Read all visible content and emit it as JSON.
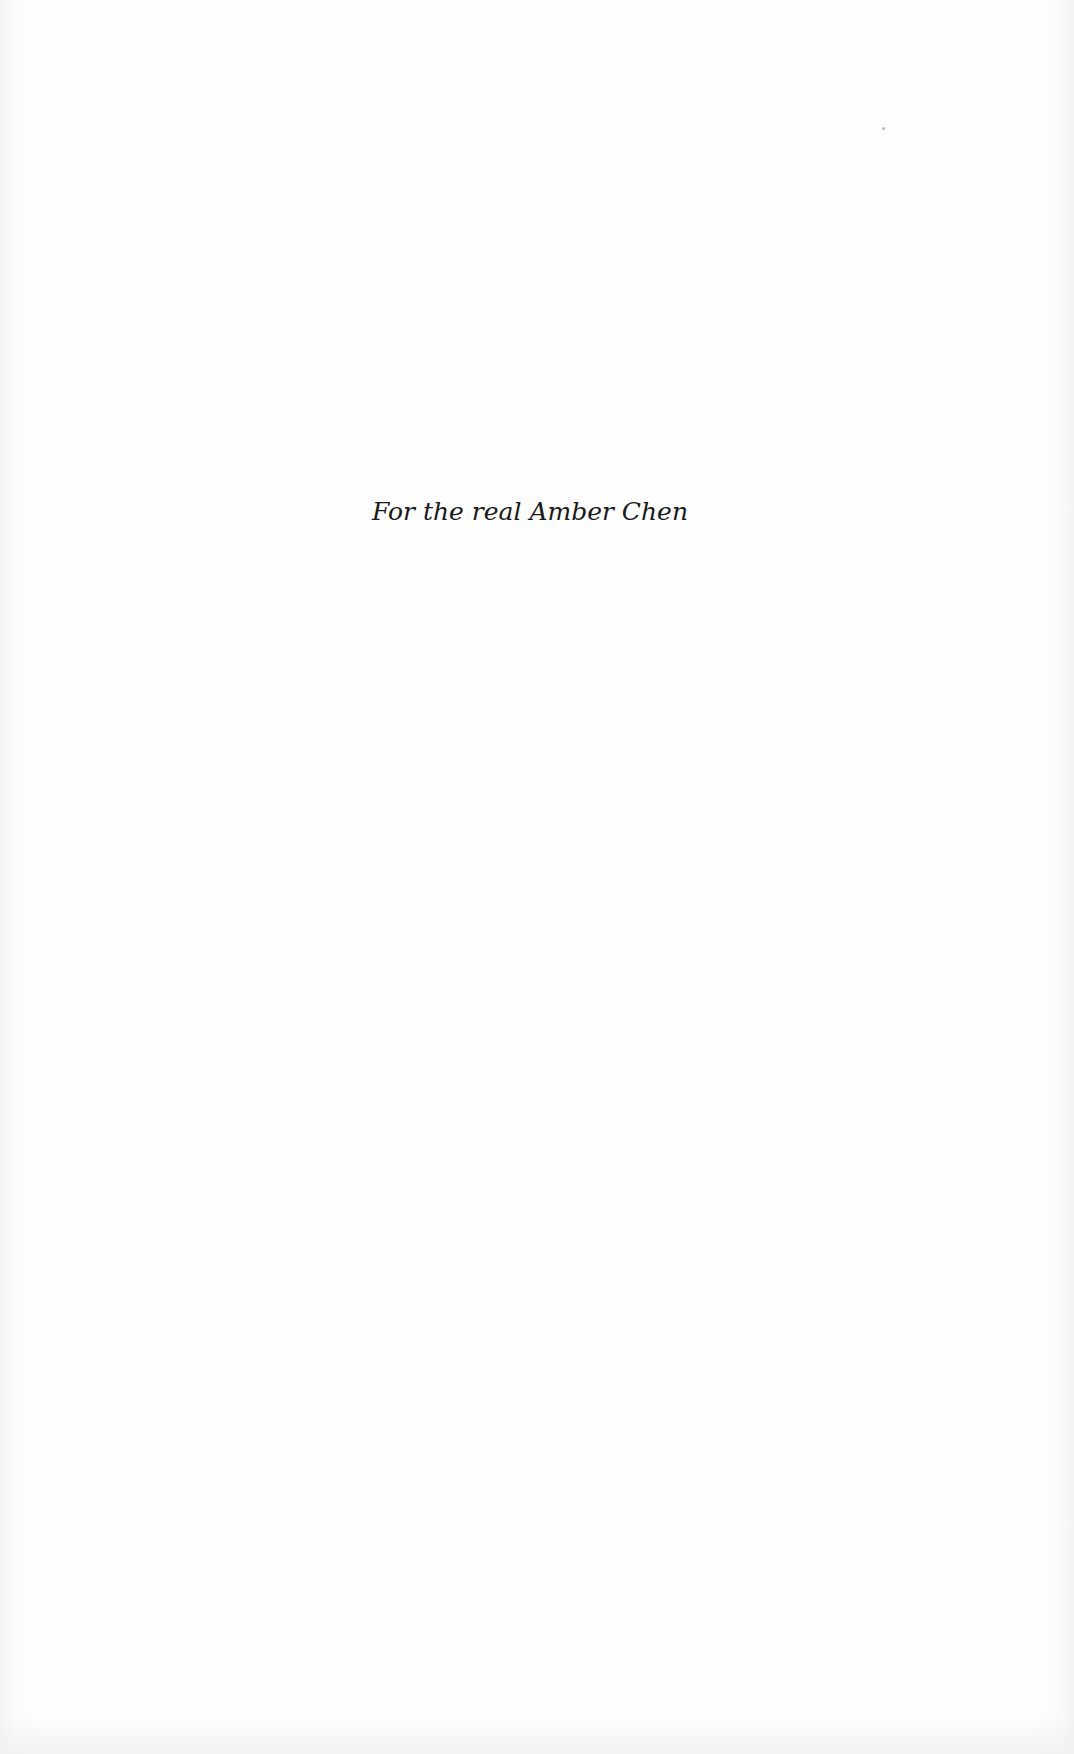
{
  "page": {
    "type": "dedication-page",
    "dedication_text": "For the real Amber Chen"
  },
  "colors": {
    "paper": "#fdfdfd",
    "text": "#1a1a1a"
  }
}
